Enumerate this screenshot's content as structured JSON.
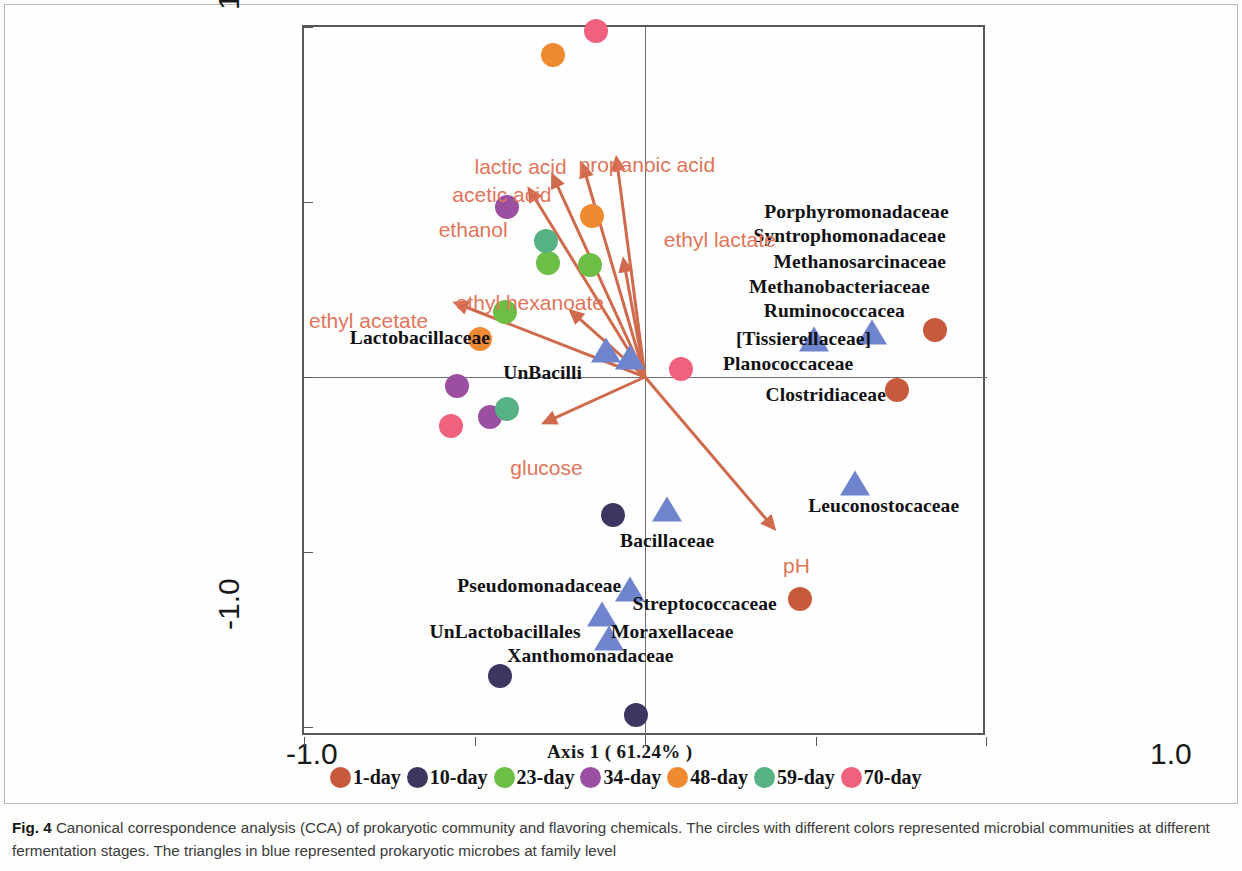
{
  "figure": {
    "number": "Fig. 4",
    "caption": " Canonical correspondence analysis (CCA) of prokaryotic community and flavoring chemicals. The circles with different colors represented microbial communities at different fermentation stages. The triangles in blue represented prokaryotic microbes at family level"
  },
  "chart_data": {
    "type": "scatter",
    "title": "Canonical correspondence analysis (CCA) of prokaryotic community and flavoring chemicals",
    "xlabel": "Axis 1 ( 61.24% )",
    "ylabel": "Axis 2 ( 25.84% )",
    "xlim": [
      -1.0,
      1.0
    ],
    "ylim": [
      -1.0,
      1.0
    ],
    "xticklabels": [
      "-1.0",
      "1.0"
    ],
    "yticklabels": [
      "1.0",
      "-1.0"
    ],
    "grid": false,
    "legend_position": "below-axis",
    "axis1_variance_pct": 61.24,
    "axis2_variance_pct": 25.84,
    "series": [
      {
        "name": "1-day",
        "color": "#c75a3c",
        "marker": "circle",
        "points": [
          [
            0.85,
            0.135
          ],
          [
            0.74,
            -0.036
          ],
          [
            0.455,
            -0.635
          ]
        ]
      },
      {
        "name": "10-day",
        "color": "#3e3660",
        "marker": "circle",
        "points": [
          [
            -0.095,
            -0.395
          ],
          [
            -0.425,
            -0.855
          ],
          [
            -0.025,
            -0.965
          ]
        ]
      },
      {
        "name": "23-day",
        "color": "#6cbe45",
        "marker": "circle",
        "points": [
          [
            -0.285,
            0.325
          ],
          [
            -0.41,
            0.185
          ],
          [
            -0.16,
            0.32
          ]
        ]
      },
      {
        "name": "34-day",
        "color": "#9b4fa0",
        "marker": "circle",
        "points": [
          [
            -0.405,
            0.485
          ],
          [
            -0.55,
            -0.025
          ],
          [
            -0.455,
            -0.115
          ]
        ]
      },
      {
        "name": "48-day",
        "color": "#ef8a33",
        "marker": "circle",
        "points": [
          [
            -0.27,
            0.92
          ],
          [
            -0.485,
            0.11
          ],
          [
            -0.155,
            0.46
          ]
        ]
      },
      {
        "name": "59-day",
        "color": "#56b183",
        "marker": "circle",
        "points": [
          [
            -0.29,
            0.39
          ],
          [
            -0.405,
            -0.09
          ]
        ]
      },
      {
        "name": "70-day",
        "color": "#f0617e",
        "marker": "circle",
        "points": [
          [
            -0.145,
            0.99
          ],
          [
            -0.57,
            -0.14
          ],
          [
            0.105,
            0.022
          ]
        ]
      }
    ],
    "taxa": [
      {
        "label": "Porphyromonadaceae",
        "x": 0.62,
        "y": 0.47
      },
      {
        "label": "Syntrophomonadaceae",
        "x": 0.6,
        "y": 0.4
      },
      {
        "label": "Methanosarcinaceae",
        "x": 0.63,
        "y": 0.325
      },
      {
        "label": "Methanobacteriaceae",
        "x": 0.57,
        "y": 0.255
      },
      {
        "label": "Ruminococcacea",
        "x": 0.555,
        "y": 0.185
      },
      {
        "label": "[Tissierellaceae]",
        "x": 0.465,
        "y": 0.105
      },
      {
        "label": "Planococcaceae",
        "x": 0.42,
        "y": 0.035
      },
      {
        "label": "Clostridiaceae",
        "x": 0.53,
        "y": -0.055
      },
      {
        "label": "Leuconostocaceae",
        "x": 0.7,
        "y": -0.37
      },
      {
        "label": "Lactobacillaceae",
        "x": -0.66,
        "y": 0.11
      },
      {
        "label": "UnBacilli",
        "x": -0.3,
        "y": 0.01
      },
      {
        "label": "Bacillaceae",
        "x": 0.065,
        "y": -0.47
      },
      {
        "label": "Pseudomonadaceae",
        "x": -0.31,
        "y": -0.6
      },
      {
        "label": "Streptococcaceae",
        "x": 0.175,
        "y": -0.65
      },
      {
        "label": "Moraxellaceae",
        "x": 0.08,
        "y": -0.73
      },
      {
        "label": "UnLactobacillales",
        "x": -0.41,
        "y": -0.73
      },
      {
        "label": "Xanthomonadaceae",
        "x": -0.16,
        "y": -0.8
      }
    ],
    "taxa_markers": [
      {
        "x": 0.495,
        "y": 0.1
      },
      {
        "x": 0.665,
        "y": 0.12
      },
      {
        "x": 0.615,
        "y": -0.31
      },
      {
        "x": -0.115,
        "y": 0.07
      },
      {
        "x": -0.045,
        "y": 0.05
      },
      {
        "x": 0.065,
        "y": -0.385
      },
      {
        "x": -0.045,
        "y": -0.615
      },
      {
        "x": -0.125,
        "y": -0.685
      },
      {
        "x": -0.105,
        "y": -0.755
      }
    ],
    "vectors": [
      {
        "label": "ethanol",
        "x": -0.345,
        "y": 0.545,
        "label_x": -0.605,
        "label_y": 0.415
      },
      {
        "label": "acetic acid",
        "x": -0.275,
        "y": 0.585,
        "label_x": -0.565,
        "label_y": 0.515
      },
      {
        "label": "lactic acid",
        "x": -0.185,
        "y": 0.615,
        "label_x": -0.5,
        "label_y": 0.595
      },
      {
        "label": "propanoic acid",
        "x": -0.085,
        "y": 0.635,
        "label_x": -0.195,
        "label_y": 0.6
      },
      {
        "label": "ethyl lactate",
        "x": -0.065,
        "y": 0.345,
        "label_x": 0.055,
        "label_y": 0.385
      },
      {
        "label": "ethyl hexanoate",
        "x": -0.225,
        "y": 0.195,
        "label_x": -0.555,
        "label_y": 0.205
      },
      {
        "label": "ethyl acetate",
        "x": -0.565,
        "y": 0.215,
        "label_x": -0.985,
        "label_y": 0.155
      },
      {
        "label": "glucose",
        "x": -0.305,
        "y": -0.135,
        "label_x": -0.395,
        "label_y": -0.265
      },
      {
        "label": "pH",
        "x": 0.385,
        "y": -0.44,
        "label_x": 0.405,
        "label_y": -0.545
      }
    ],
    "legend": [
      {
        "label": "1-day",
        "color": "#c75a3c"
      },
      {
        "label": "10-day",
        "color": "#3e3660"
      },
      {
        "label": "23-day",
        "color": "#6cbe45"
      },
      {
        "label": "34-day",
        "color": "#9b4fa0"
      },
      {
        "label": "48-day",
        "color": "#ef8a33"
      },
      {
        "label": "59-day",
        "color": "#56b183"
      },
      {
        "label": "70-day",
        "color": "#f0617e"
      }
    ],
    "triangle_color": "#6f84cd",
    "vector_color": "#cf6a4d"
  }
}
